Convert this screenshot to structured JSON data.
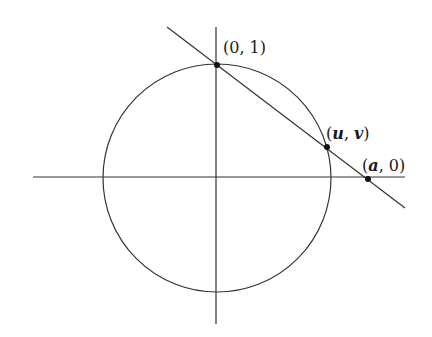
{
  "diagram": {
    "colors": {
      "stroke": "#333333",
      "background": "#ffffff"
    },
    "labels": {
      "top_point": "(0, 1)",
      "uv_open": "(",
      "uv_u": "u",
      "uv_sep": ", ",
      "uv_v": "v",
      "uv_close": ")",
      "a_open": "(",
      "a_a": "a",
      "a_rest": ", 0)"
    },
    "points": [
      {
        "name": "(0, 1)",
        "px": [
          217,
          65
        ]
      },
      {
        "name": "(u, v)",
        "px": [
          327,
          147
        ]
      },
      {
        "name": "(a, 0)",
        "px": [
          368,
          179
        ]
      }
    ]
  }
}
